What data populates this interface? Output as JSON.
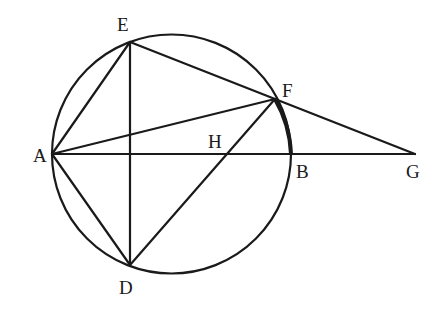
{
  "diagram": {
    "type": "geometry",
    "circle": {
      "center": [
        171.5,
        154
      ],
      "radius": 119.5
    },
    "points": {
      "A": {
        "label": "A",
        "x": 52,
        "y": 154,
        "lx": 33,
        "ly": 162
      },
      "E": {
        "label": "E",
        "x": 130,
        "y": 42,
        "lx": 117,
        "ly": 31
      },
      "D": {
        "label": "D",
        "x": 130,
        "y": 265,
        "lx": 119,
        "ly": 294
      },
      "F": {
        "label": "F",
        "x": 275,
        "y": 99,
        "lx": 282,
        "ly": 97
      },
      "H": {
        "label": "H",
        "x": 228,
        "y": 154,
        "lx": 208,
        "ly": 148
      },
      "B": {
        "label": "B",
        "x": 291,
        "y": 154,
        "lx": 296,
        "ly": 178
      },
      "G": {
        "label": "G",
        "x": 415,
        "y": 154,
        "lx": 406,
        "ly": 178
      }
    },
    "segments": [
      [
        "A",
        "G"
      ],
      [
        "A",
        "E"
      ],
      [
        "A",
        "D"
      ],
      [
        "A",
        "F"
      ],
      [
        "E",
        "D"
      ],
      [
        "E",
        "F"
      ],
      [
        "F",
        "G"
      ],
      [
        "D",
        "F"
      ]
    ],
    "emphasized_arc": [
      "F",
      "B"
    ]
  }
}
